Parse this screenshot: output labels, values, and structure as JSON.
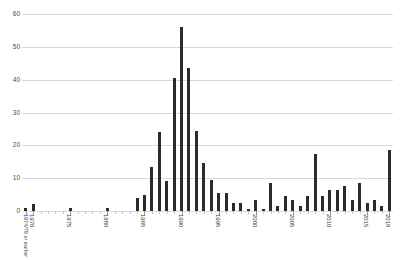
{
  "chart_data": {
    "type": "bar",
    "title": "",
    "xlabel": "",
    "ylabel": "",
    "ylim": [
      0,
      60
    ],
    "ytick_values": [
      0,
      10,
      20,
      30,
      40,
      50,
      60
    ],
    "ytick_labels": [
      "0",
      "10",
      "20",
      "30",
      "40",
      "50",
      "60"
    ],
    "grid": true,
    "legend": "none",
    "bar_color": "#2b2b2b",
    "gridline_color": "#d9d9d9",
    "categories": [
      "1974/79 or earlier",
      "1970",
      "1971",
      "1972",
      "1973",
      "1974",
      "1975",
      "1976",
      "1977",
      "1978",
      "1979",
      "1980",
      "1981",
      "1982",
      "1983",
      "1984",
      "1985",
      "1986",
      "1987",
      "1988",
      "1989",
      "1990",
      "1991",
      "1992",
      "1993",
      "1994",
      "1995",
      "1996",
      "1997",
      "1998",
      "1999",
      "2000",
      "2001",
      "2002",
      "2003",
      "2004",
      "2005",
      "2006",
      "2007",
      "2008",
      "2009",
      "2010",
      "2011",
      "2012",
      "2013",
      "2014",
      "2015",
      "2016",
      "2017",
      "2018"
    ],
    "values": [
      1,
      2,
      0,
      0,
      0,
      0,
      1,
      0,
      0,
      0,
      0,
      1,
      0,
      0,
      0,
      4,
      5,
      13.5,
      24,
      9,
      40.5,
      56,
      43.5,
      24.5,
      14.5,
      9.5,
      5.5,
      5.5,
      2.5,
      2.5,
      0.7,
      3.5,
      0.5,
      8.5,
      1.5,
      4.5,
      3.5,
      1.5,
      4.5,
      17.5,
      4.5,
      6.5,
      6.5,
      7.5,
      3.5,
      8.5,
      2.5,
      3.5,
      1.5,
      18.5
    ],
    "axis_labeled_years": [
      "1974/79 or earlier",
      "1970",
      "1975",
      "1980",
      "1985",
      "1990",
      "1995",
      "2000",
      "2005",
      "2010",
      "2015",
      "2018"
    ]
  }
}
